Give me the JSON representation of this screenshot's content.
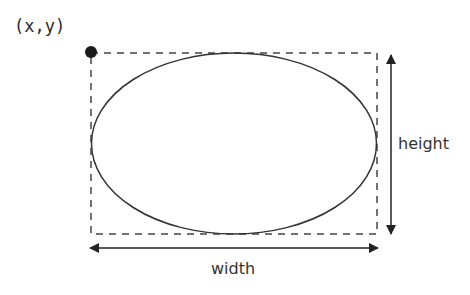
{
  "diagram": {
    "title": "",
    "labels": {
      "origin": "(x,y)",
      "height": "height",
      "width": "width"
    },
    "shapes": {
      "bounding_box": {
        "style": "dashed",
        "x": 91,
        "y": 53,
        "w": 286,
        "h": 181
      },
      "ellipse": {
        "cx": 234,
        "cy": 143.5,
        "rx": 142.5,
        "ry": 90.5
      },
      "origin_point": {
        "cx": 91,
        "cy": 52,
        "r": 6
      }
    },
    "colors": {
      "stroke": "#333333",
      "dash": "#444444",
      "point": "#1a1a1a",
      "background": "#ffffff"
    }
  }
}
